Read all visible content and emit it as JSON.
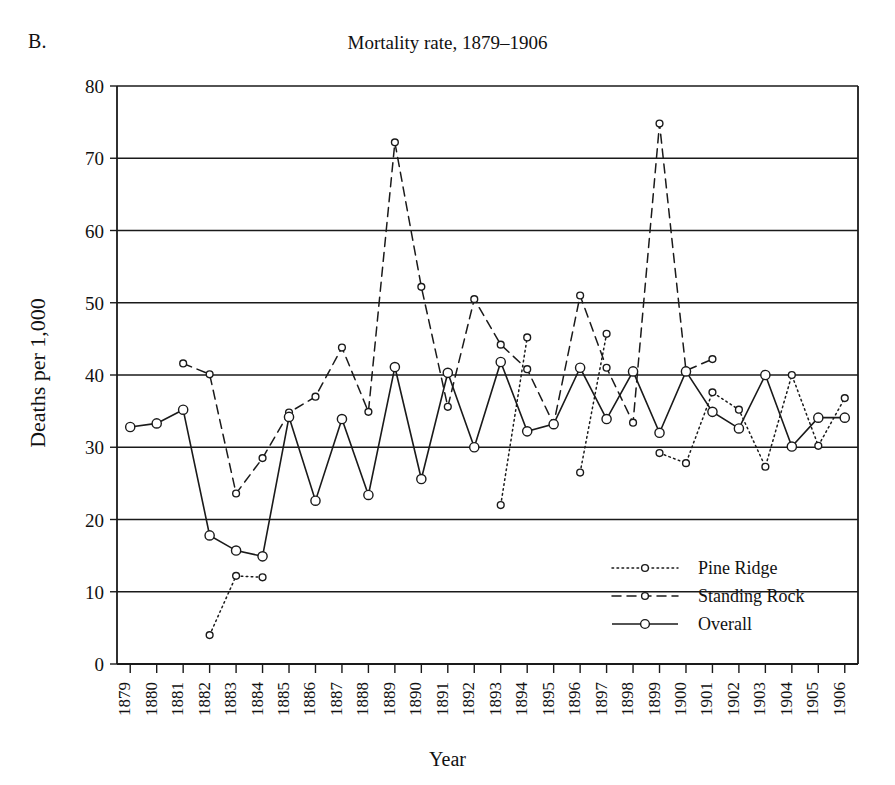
{
  "figure": {
    "panel_label": "B.",
    "title": "Mortality rate, 1879–1906",
    "ylabel": "Deaths per 1,000",
    "xlabel": "Year"
  },
  "legend": {
    "position": "inside-bottom-right",
    "items": [
      {
        "label": "Pine Ridge",
        "style": "dotted",
        "marker": "open-circle",
        "color": "#111111"
      },
      {
        "label": "Standing Rock",
        "style": "dashed",
        "marker": "open-circle",
        "color": "#111111"
      },
      {
        "label": "Overall",
        "style": "solid",
        "marker": "open-circle",
        "color": "#111111"
      }
    ]
  },
  "axes": {
    "y_ticks": [
      0,
      10,
      20,
      30,
      40,
      50,
      60,
      70,
      80
    ],
    "y_tick_labels": [
      "0",
      "10",
      "20",
      "30",
      "40",
      "50",
      "60",
      "70",
      "80"
    ],
    "ylim": [
      0,
      80
    ],
    "x_tick_labels": [
      "1879",
      "1880",
      "1881",
      "1882",
      "1883",
      "1884",
      "1885",
      "1886",
      "1887",
      "1888",
      "1889",
      "1890",
      "1891",
      "1892",
      "1893",
      "1894",
      "1895",
      "1896",
      "1897",
      "1898",
      "1899",
      "1900",
      "1901",
      "1902",
      "1903",
      "1904",
      "1905",
      "1906"
    ],
    "grid": "horizontal"
  },
  "chart_data": {
    "type": "line",
    "title": "Mortality rate, 1879–1906",
    "xlabel": "Year",
    "ylabel": "Deaths per 1,000",
    "ylim": [
      0,
      80
    ],
    "grid": true,
    "legend_position": "inside-bottom-right",
    "categories": [
      "1879",
      "1880",
      "1881",
      "1882",
      "1883",
      "1884",
      "1885",
      "1886",
      "1887",
      "1888",
      "1889",
      "1890",
      "1891",
      "1892",
      "1893",
      "1894",
      "1895",
      "1896",
      "1897",
      "1898",
      "1899",
      "1900",
      "1901",
      "1902",
      "1903",
      "1904",
      "1905",
      "1906"
    ],
    "series": [
      {
        "name": "Pine Ridge",
        "style": "dotted",
        "marker": "open-circle",
        "values": [
          null,
          null,
          null,
          4.0,
          12.2,
          12.0,
          null,
          null,
          null,
          null,
          null,
          null,
          null,
          null,
          22.0,
          45.2,
          null,
          26.5,
          45.7,
          null,
          29.2,
          27.8,
          37.6,
          35.2,
          27.3,
          40.0,
          30.2,
          36.8
        ]
      },
      {
        "name": "Standing Rock",
        "style": "dashed",
        "marker": "open-circle",
        "values": [
          null,
          null,
          41.6,
          40.1,
          23.6,
          28.5,
          34.8,
          37.0,
          43.8,
          34.9,
          72.2,
          52.2,
          35.6,
          50.5,
          44.2,
          40.8,
          33.2,
          51.0,
          41.0,
          33.4,
          74.8,
          40.6,
          42.2,
          null,
          null,
          null,
          null,
          null
        ]
      },
      {
        "name": "Overall",
        "style": "solid",
        "marker": "open-circle",
        "values": [
          32.8,
          33.3,
          35.2,
          17.8,
          15.7,
          14.9,
          34.2,
          22.6,
          33.9,
          23.4,
          41.1,
          25.6,
          40.3,
          30.0,
          41.8,
          32.2,
          33.2,
          41.0,
          33.9,
          40.5,
          32.0,
          40.5,
          34.9,
          32.6,
          40.0,
          30.1,
          34.1,
          34.1
        ]
      }
    ]
  }
}
